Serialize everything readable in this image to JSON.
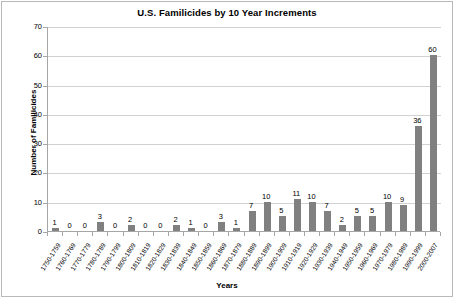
{
  "chart_data": {
    "type": "bar",
    "title": "U.S. Familicides by 10 Year Increments",
    "xlabel": "Years",
    "ylabel": "Number of Familicides",
    "ylim": [
      0,
      70
    ],
    "yticks": [
      0,
      10,
      20,
      30,
      40,
      50,
      60,
      70
    ],
    "grid": true,
    "legend": "none",
    "bar_color": "#808080",
    "data_labels": true,
    "categories": [
      "1750-1759",
      "1760-1769",
      "1770-1779",
      "1780-1789",
      "1790-1799",
      "1800-1809",
      "1810-1819",
      "1820-1829",
      "1830-1839",
      "1840-1849",
      "1850-1859",
      "1860-1869",
      "1870-1879",
      "1880-1889",
      "1890-1899",
      "1900-1909",
      "1910-1919",
      "1920-1929",
      "1930-1939",
      "1940-1949",
      "1950-1959",
      "1960-1969",
      "1970-1979",
      "1980-1989",
      "1990-1999",
      "2000-2007"
    ],
    "values": [
      1,
      0,
      0,
      3,
      0,
      2,
      0,
      0,
      2,
      1,
      0,
      3,
      1,
      7,
      10,
      5,
      11,
      10,
      7,
      2,
      5,
      5,
      10,
      9,
      36,
      60
    ]
  }
}
